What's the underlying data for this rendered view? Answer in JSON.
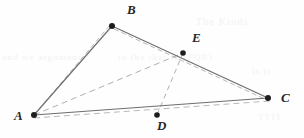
{
  "figure": {
    "width": 304,
    "height": 138,
    "background_color": "#fefefe",
    "solid_edge_color": "#6e6e72",
    "dashed_edge_color": "#b9b9bd",
    "dashed_cevian_color": "#b0b0b4",
    "vertex_dot_color": "#1d1d1f",
    "label_color": "#262626",
    "ghost_text_color": "#e9e9ea"
  },
  "points": [
    {
      "name": "A",
      "label": "A",
      "x": 34,
      "y": 115,
      "label_x": 14,
      "label_y": 109,
      "dot_radius": 3.0
    },
    {
      "name": "B",
      "label": "B",
      "x": 112,
      "y": 26,
      "label_x": 127,
      "label_y": 3,
      "dot_radius": 3.0
    },
    {
      "name": "C",
      "label": "C",
      "x": 268,
      "y": 98,
      "label_x": 281,
      "label_y": 91,
      "dot_radius": 3.0
    },
    {
      "name": "D",
      "label": "D",
      "x": 157,
      "y": 115,
      "label_x": 157,
      "label_y": 119,
      "dot_radius": 2.8
    },
    {
      "name": "E",
      "label": "E",
      "x": 183,
      "y": 53,
      "label_x": 192,
      "label_y": 31,
      "dot_radius": 2.8
    }
  ],
  "solid_edges": [
    {
      "name": "edge-AB",
      "from": "A",
      "to": "B"
    },
    {
      "name": "edge-BC",
      "from": "B",
      "to": "C"
    },
    {
      "name": "edge-AC",
      "from": "A",
      "to": "C"
    }
  ],
  "dashed_edges": [
    {
      "name": "dashed-edge-AB",
      "x1": 34,
      "y1": 115,
      "x2": 110,
      "y2": 25,
      "dash": "5,3"
    },
    {
      "name": "dashed-edge-BC",
      "x1": 114,
      "y1": 29,
      "x2": 269,
      "y2": 101,
      "dash": "5,3"
    },
    {
      "name": "dashed-edge-AC",
      "x1": 34,
      "y1": 118,
      "x2": 270,
      "y2": 101,
      "dash": "6,4"
    }
  ],
  "dashed_cevians": [
    {
      "name": "cevian-AE",
      "from": "A",
      "to": "E",
      "dash": "6,4"
    },
    {
      "name": "cevian-DE",
      "from": "D",
      "to": "E",
      "dash": "5,4"
    }
  ],
  "ghost_texts": [
    {
      "name": "ghost-top-right",
      "text": "The  Kinds",
      "x": 196,
      "y": 16,
      "size": 10,
      "opacity": 0.55
    },
    {
      "name": "ghost-mid-left",
      "text": "and   we  arguments",
      "x": 2,
      "y": 52,
      "size": 9,
      "opacity": 0.5
    },
    {
      "name": "ghost-mid-center",
      "text": "to  the   that   to  (PQR)",
      "x": 118,
      "y": 52,
      "size": 9,
      "opacity": 0.5
    },
    {
      "name": "ghost-mid-right",
      "text": "is  it",
      "x": 252,
      "y": 66,
      "size": 9,
      "opacity": 0.5
    },
    {
      "name": "ghost-bottom-right",
      "text": "TTIT",
      "x": 258,
      "y": 112,
      "size": 9,
      "opacity": 0.5
    }
  ]
}
